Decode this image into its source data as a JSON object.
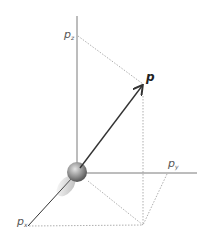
{
  "diagram": {
    "type": "3d-momentum-vector",
    "labels": {
      "vector": "p",
      "z_component": "p",
      "z_sub": "z",
      "y_component": "p",
      "y_sub": "y",
      "x_component": "p",
      "x_sub": "x"
    },
    "colors": {
      "axis": "#7a7a7a",
      "vector": "#333333",
      "dotted": "#9a9a9a",
      "sphere_light": "#d8d8d8",
      "sphere_dark": "#555555"
    }
  }
}
